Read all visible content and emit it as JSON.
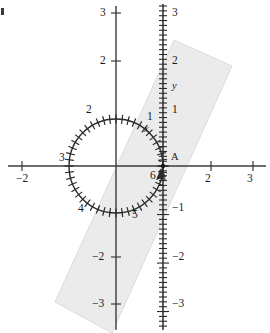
{
  "figure": {
    "type": "math-diagram",
    "background_color": "#ffffff",
    "ink_color": "#1a1a1a",
    "band_fill_color": "#ebebeb",
    "band_stroke_color": "#d8d8d8"
  },
  "horizontal_axis": {
    "name": "x-axis",
    "y_pixel": 166,
    "ticks": [
      {
        "label": "−2",
        "x": 22
      },
      {
        "label": "2",
        "x": 211
      },
      {
        "label": "3",
        "x": 253
      }
    ]
  },
  "plain_vertical_axis": {
    "name": "left-vertical-axis",
    "x_pixel": 116,
    "ticks": [
      {
        "label": "3",
        "y": 13
      },
      {
        "label": "2",
        "y": 61
      },
      {
        "label": "−2",
        "y": 257
      },
      {
        "label": "−3",
        "y": 304
      }
    ]
  },
  "tick_vertical_axis": {
    "name": "y-axis-ruler",
    "x_pixel": 163,
    "axis_label": "y",
    "labels": [
      {
        "label": "3",
        "y": 13
      },
      {
        "label": "2",
        "y": 61
      },
      {
        "label": "y",
        "y": 87,
        "italic": true
      },
      {
        "label": "1",
        "y": 110
      },
      {
        "label": "−1",
        "y": 208
      },
      {
        "label": "−2",
        "y": 257
      },
      {
        "label": "−3",
        "y": 304
      }
    ]
  },
  "point": {
    "name": "point-A",
    "label": "A",
    "x": 163,
    "y": 166
  },
  "circle": {
    "name": "numbered-circle",
    "center_x": 116,
    "center_y": 166,
    "radius": 47,
    "tick_count": 48,
    "labels": [
      {
        "label": "1",
        "x": 147,
        "y": 111
      },
      {
        "label": "2",
        "x": 86,
        "y": 104
      },
      {
        "label": "3",
        "x": 59,
        "y": 152
      },
      {
        "label": "4",
        "x": 78,
        "y": 203
      },
      {
        "label": "5",
        "x": 132,
        "y": 209
      },
      {
        "label": "6",
        "x": 150,
        "y": 170
      }
    ],
    "variable_label": "x"
  },
  "shaded_band": {
    "name": "shaded-parallelogram",
    "points": "174,40 232,66 112,333 55,302"
  },
  "corner_mark": {
    "name": "crop-corner-mark",
    "visible": true
  }
}
